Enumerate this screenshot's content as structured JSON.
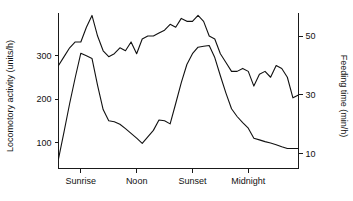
{
  "chart_data": {
    "type": "line",
    "title": "",
    "xlabel": "",
    "ylabel": "Locomotory activity (units/h)",
    "y2label": "Feeding time (min/h)",
    "grid": false,
    "legend": "none",
    "x_categories": [
      "Sunrise",
      "Noon",
      "Sunset",
      "Midnight"
    ],
    "x_category_positions": [
      4,
      14,
      24,
      34
    ],
    "xlim": [
      0,
      43
    ],
    "ylim": [
      40,
      400
    ],
    "y_ticks": [
      100,
      200,
      300
    ],
    "y_tick_labels": [
      "100",
      "200",
      "300"
    ],
    "y2lim": [
      5,
      58
    ],
    "y2_ticks": [
      10,
      30,
      50
    ],
    "y2_tick_labels": [
      "10",
      "30",
      "50"
    ],
    "series": [
      {
        "name": "Locomotory activity",
        "axis": "left",
        "unit": "units/h",
        "x": [
          0,
          1,
          2,
          3,
          4,
          5,
          6,
          7,
          8,
          9,
          10,
          11,
          12,
          13,
          14,
          15,
          16,
          17,
          18,
          19,
          20,
          21,
          22,
          23,
          24,
          25,
          26,
          27,
          28,
          29,
          30,
          31,
          32,
          33,
          34,
          35,
          36,
          37,
          38,
          39,
          40,
          41,
          42,
          43
        ],
        "values": [
          62,
          125,
          190,
          250,
          306,
          300,
          294,
          232,
          176,
          150,
          148,
          142,
          132,
          121,
          110,
          98,
          113,
          128,
          152,
          150,
          143,
          190,
          238,
          280,
          305,
          320,
          322,
          324,
          296,
          254,
          214,
          178,
          160,
          146,
          133,
          110,
          106,
          102,
          99,
          95,
          90,
          86,
          86,
          86
        ]
      },
      {
        "name": "Feeding time",
        "axis": "right",
        "unit": "min/h",
        "x": [
          0,
          1,
          2,
          3,
          4,
          5,
          6,
          7,
          8,
          9,
          10,
          11,
          12,
          13,
          14,
          15,
          16,
          17,
          18,
          19,
          20,
          21,
          22,
          23,
          24,
          25,
          26,
          27,
          28,
          29,
          30,
          31,
          32,
          33,
          34,
          35,
          36,
          37,
          38,
          39,
          40,
          41,
          42,
          43
        ],
        "values": [
          40,
          43,
          46,
          48,
          48,
          53,
          57,
          50,
          45,
          43,
          44,
          46,
          45,
          48,
          44,
          49,
          50,
          50,
          51,
          52,
          54,
          53,
          56,
          55,
          55,
          57,
          55,
          50,
          49,
          44,
          41,
          38,
          38,
          39,
          38,
          33,
          37,
          38,
          36,
          40,
          39,
          36,
          29,
          30
        ]
      }
    ]
  }
}
